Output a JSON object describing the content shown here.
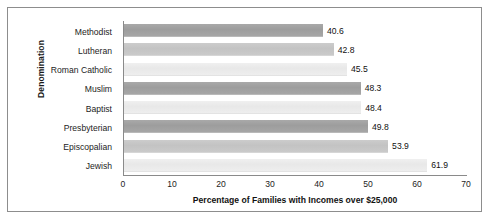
{
  "chart_data": {
    "type": "bar",
    "orientation": "horizontal",
    "title": "",
    "xlabel": "Percentage of Families with Incomes over $25,000",
    "ylabel": "Denomination",
    "categories": [
      "Methodist",
      "Lutheran",
      "Roman Catholic",
      "Muslim",
      "Baptist",
      "Presbyterian",
      "Episcopalian",
      "Jewish"
    ],
    "values": [
      40.6,
      42.8,
      45.5,
      48.3,
      48.4,
      49.8,
      53.9,
      61.9
    ],
    "value_labels": [
      "40.6",
      "42.8",
      "45.5",
      "48.3",
      "48.4",
      "49.8",
      "53.9",
      "61.9"
    ],
    "bar_shades": [
      "dark",
      "mid",
      "light",
      "dark",
      "light",
      "dark",
      "mid",
      "light"
    ],
    "xlim": [
      0,
      70
    ],
    "xticks": [
      0,
      10,
      20,
      30,
      40,
      50,
      60,
      70
    ],
    "xtick_labels": [
      "0",
      "10",
      "20",
      "30",
      "40",
      "50",
      "60",
      "70"
    ],
    "grid": false,
    "legend": "none",
    "colors": {
      "bar_dark": "#a0a0a0",
      "bar_mid": "#c7c7c7",
      "bar_light": "#ececec",
      "axis": "#8a8a8a",
      "frame": "#8d8d8d",
      "text": "#1a1a1a",
      "background": "#ffffff"
    }
  }
}
